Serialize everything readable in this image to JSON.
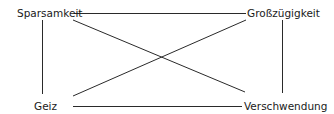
{
  "diagram": {
    "type": "square-of-opposition",
    "nodes": {
      "top_left": {
        "label": "Sparsamkeit"
      },
      "top_right": {
        "label": "Großzügigkeit"
      },
      "bottom_left": {
        "label": "Geiz"
      },
      "bottom_right": {
        "label": "Verschwendung"
      }
    },
    "edges": [
      {
        "from": "top_left",
        "to": "top_right",
        "kind": "horizontal"
      },
      {
        "from": "bottom_left",
        "to": "bottom_right",
        "kind": "horizontal"
      },
      {
        "from": "top_left",
        "to": "bottom_left",
        "kind": "vertical"
      },
      {
        "from": "top_right",
        "to": "bottom_right",
        "kind": "vertical"
      },
      {
        "from": "top_left",
        "to": "bottom_right",
        "kind": "diagonal"
      },
      {
        "from": "bottom_left",
        "to": "top_right",
        "kind": "diagonal"
      }
    ],
    "line_color": "#2a2a2a",
    "text_color": "#1a1a1a"
  }
}
